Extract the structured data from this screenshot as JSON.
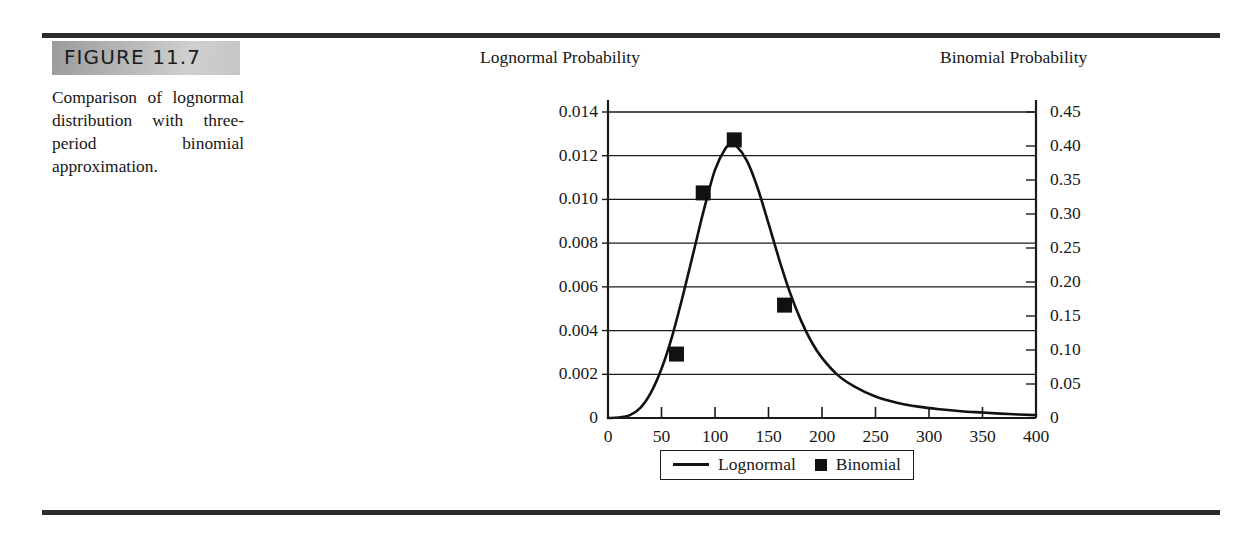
{
  "figure": {
    "label": "FIGURE 11.7",
    "caption": "Comparison of lognormal distribution with three-period binomial approximation."
  },
  "chart_data": {
    "type": "line",
    "title": "",
    "left_axis": {
      "label": "Lognormal Probability",
      "ticks": [
        "0",
        "0.002",
        "0.004",
        "0.006",
        "0.008",
        "0.010",
        "0.012",
        "0.014"
      ],
      "min": 0,
      "max": 0.014,
      "step": 0.002,
      "grid": true
    },
    "right_axis": {
      "label": "Binomial Probability",
      "ticks": [
        "0",
        "0.05",
        "0.10",
        "0.15",
        "0.20",
        "0.25",
        "0.30",
        "0.35",
        "0.40",
        "0.45"
      ],
      "min": 0,
      "max": 0.45,
      "step": 0.05,
      "grid": false
    },
    "xaxis": {
      "label": "",
      "ticks": [
        "0",
        "50",
        "100",
        "150",
        "200",
        "250",
        "300",
        "350",
        "400"
      ],
      "min": 0,
      "max": 400,
      "step": 50
    },
    "legend": {
      "position": "bottom-center",
      "entries": [
        {
          "name": "Lognormal",
          "marker": "line"
        },
        {
          "name": "Binomial",
          "marker": "square"
        }
      ]
    },
    "series": [
      {
        "name": "Lognormal",
        "axis": "left",
        "type": "line",
        "color": "#111111",
        "x": [
          0,
          10,
          20,
          30,
          40,
          50,
          60,
          70,
          80,
          90,
          100,
          110,
          115,
          120,
          130,
          140,
          150,
          160,
          170,
          180,
          190,
          200,
          215,
          230,
          250,
          270,
          290,
          310,
          330,
          350,
          375,
          400
        ],
        "y": [
          0.0,
          2e-05,
          0.00012,
          0.00045,
          0.00115,
          0.00225,
          0.00375,
          0.0056,
          0.0076,
          0.0096,
          0.01135,
          0.01235,
          0.0125,
          0.01245,
          0.01175,
          0.0105,
          0.0089,
          0.00725,
          0.00575,
          0.0045,
          0.0035,
          0.00275,
          0.00195,
          0.00145,
          0.00098,
          0.0007,
          0.00052,
          0.0004,
          0.00031,
          0.00025,
          0.00018,
          0.00013
        ]
      },
      {
        "name": "Binomial",
        "axis": "right",
        "type": "scatter",
        "color": "#111111",
        "marker": "filled-square",
        "x": [
          64,
          89,
          118,
          165
        ],
        "y": [
          0.094,
          0.331,
          0.409,
          0.166
        ]
      }
    ]
  }
}
